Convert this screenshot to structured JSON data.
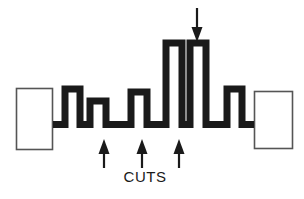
{
  "figure": {
    "title_visible": false,
    "caption": "CUTS",
    "background_color": "#ffffff",
    "stroke_color": "#1a1a1a",
    "thin_stroke_color": "#555555",
    "width": 304,
    "height": 199
  },
  "labels": {
    "cuts": "CUTS"
  },
  "chart_data": {
    "type": "diagram-profile",
    "title": "",
    "xlabel": "",
    "ylabel": "",
    "baseline_y": 128,
    "stroke_width": 7,
    "end_blocks": [
      {
        "name": "left-end-block",
        "x": 16,
        "y": 88,
        "width": 37,
        "height": 62
      },
      {
        "name": "right-end-block",
        "x": 254,
        "y": 91,
        "width": 39,
        "height": 58
      }
    ],
    "profile_points": [
      [
        53,
        121
      ],
      [
        65,
        121
      ],
      [
        65,
        89
      ],
      [
        80,
        89
      ],
      [
        80,
        121
      ],
      [
        90,
        121
      ],
      [
        90,
        101
      ],
      [
        106,
        101
      ],
      [
        106,
        121
      ],
      [
        131,
        121
      ],
      [
        131,
        92
      ],
      [
        147,
        92
      ],
      [
        147,
        121
      ],
      [
        166,
        121
      ],
      [
        166,
        43
      ],
      [
        182,
        43
      ],
      [
        182,
        121
      ],
      [
        190,
        121
      ],
      [
        190,
        43
      ],
      [
        206,
        43
      ],
      [
        206,
        121
      ],
      [
        227,
        121
      ],
      [
        227,
        89
      ],
      [
        242,
        89
      ],
      [
        242,
        121
      ],
      [
        254,
        121
      ]
    ],
    "teeth": [
      {
        "name": "tooth-1",
        "x_left": 65,
        "x_right": 80,
        "top_y": 89,
        "height": 39
      },
      {
        "name": "tooth-2",
        "x_left": 90,
        "x_right": 106,
        "top_y": 101,
        "height": 27
      },
      {
        "name": "tooth-3",
        "x_left": 131,
        "x_right": 147,
        "top_y": 92,
        "height": 36
      },
      {
        "name": "tall-block-left",
        "x_left": 166,
        "x_right": 182,
        "top_y": 43,
        "height": 85
      },
      {
        "name": "tall-block-right",
        "x_left": 190,
        "x_right": 206,
        "top_y": 43,
        "height": 85
      },
      {
        "name": "tooth-4",
        "x_left": 227,
        "x_right": 242,
        "top_y": 89,
        "height": 39
      }
    ],
    "arrows": [
      {
        "name": "arrow-down-top",
        "direction": "down",
        "x": 197,
        "y_start": 8,
        "y_end": 42
      },
      {
        "name": "arrow-up-cut-1",
        "direction": "up",
        "x": 104,
        "y_start": 168,
        "y_end": 139
      },
      {
        "name": "arrow-up-cut-2",
        "direction": "up",
        "x": 142,
        "y_start": 168,
        "y_end": 139
      },
      {
        "name": "arrow-up-cut-3",
        "direction": "up",
        "x": 179,
        "y_start": 168,
        "y_end": 139
      }
    ],
    "annotations": [
      {
        "name": "cuts-caption",
        "text": "CUTS",
        "x": 145,
        "y": 180
      }
    ]
  }
}
